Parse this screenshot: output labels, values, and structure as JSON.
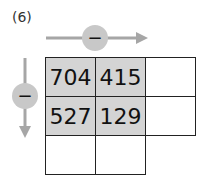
{
  "problem_label": "(6)",
  "operation": {
    "horizontal": "−",
    "vertical": "−"
  },
  "grid": {
    "rows": [
      [
        "704",
        "415",
        ""
      ],
      [
        "527",
        "129",
        ""
      ],
      [
        "",
        "",
        ""
      ]
    ],
    "shaded": [
      [
        true,
        true,
        false
      ],
      [
        true,
        true,
        false
      ],
      [
        false,
        false,
        false
      ]
    ]
  },
  "colors": {
    "arrow": "#a6a6a6",
    "circle": "#c8c8c8",
    "shade": "#d4d4d4",
    "border": "#222222"
  }
}
